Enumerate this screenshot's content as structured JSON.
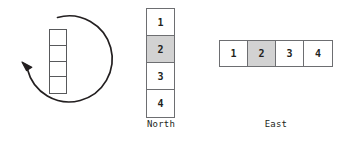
{
  "diagram": {
    "colors": {
      "cell_border": "#6d6e71",
      "shaded_cell_fill": "#d2d2d2",
      "unshaded_cell_fill": "#ffffff",
      "arrow_stroke": "#231f20",
      "text": "#231f20",
      "background": "#ffffff"
    },
    "rotation": {
      "name": "rotation-arrow",
      "direction": "counterclockwise",
      "column_cells": [
        "",
        "",
        "",
        ""
      ]
    },
    "north": {
      "caption": "North",
      "orientation": "vertical",
      "cells": [
        {
          "label": "1",
          "shaded": false
        },
        {
          "label": "2",
          "shaded": true
        },
        {
          "label": "3",
          "shaded": false
        },
        {
          "label": "4",
          "shaded": false
        }
      ]
    },
    "east": {
      "caption": "East",
      "orientation": "horizontal",
      "cells": [
        {
          "label": "1",
          "shaded": false
        },
        {
          "label": "2",
          "shaded": true
        },
        {
          "label": "3",
          "shaded": false
        },
        {
          "label": "4",
          "shaded": false
        }
      ]
    }
  }
}
